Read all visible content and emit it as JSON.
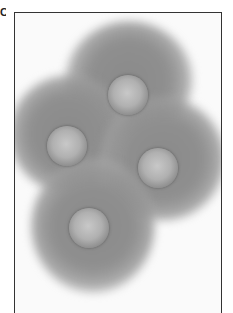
{
  "figure": {
    "panel_label": "C",
    "colors": {
      "background": "#fafafa",
      "cytoplasm": "#8a8a8a",
      "nucleus_center": "#c8c8c8",
      "nucleus_rim": "#5a5a5a",
      "frame": "#333333"
    },
    "cells": [
      {
        "id": "top",
        "cx": 128,
        "cy": 95
      },
      {
        "id": "left",
        "cx": 67,
        "cy": 146
      },
      {
        "id": "right",
        "cx": 158,
        "cy": 168
      },
      {
        "id": "bottom",
        "cx": 89,
        "cy": 228
      }
    ]
  }
}
